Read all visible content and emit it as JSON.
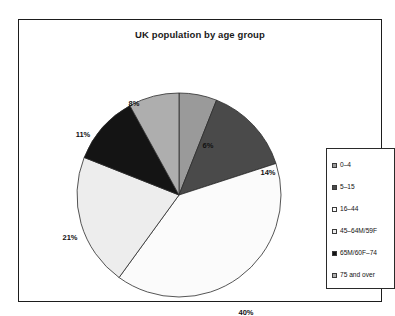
{
  "chart": {
    "title": "UK population by age group",
    "frame_color": "#1d1d1d",
    "background": "#ffffff"
  },
  "legend": {
    "position": "right",
    "border_color": "#2a2a2a",
    "items": [
      {
        "label": "0–4",
        "color": "#9a9a9a"
      },
      {
        "label": "5–15",
        "color": "#4a4a4a"
      },
      {
        "label": "16–44",
        "color": "#fbfbfb"
      },
      {
        "label": "45–64M/59F",
        "color": "#ededed"
      },
      {
        "label": "65M/60F–74",
        "color": "#141414"
      },
      {
        "label": "75 and over",
        "color": "#aeaeae"
      }
    ]
  },
  "chart_data": {
    "type": "pie",
    "title": "UK population by age group",
    "xlabel": "",
    "ylabel": "",
    "categories": [
      "0–4",
      "5–15",
      "16–44",
      "45–64M/59F",
      "65M/60F–74",
      "75 and over"
    ],
    "values": [
      6,
      14,
      40,
      21,
      11,
      8
    ],
    "unit": "%",
    "data_labels": [
      "6%",
      "14%",
      "40%",
      "21%",
      "11%",
      "8%"
    ],
    "colors": [
      "#9a9a9a",
      "#4a4a4a",
      "#fbfbfb",
      "#ededed",
      "#141414",
      "#aeaeae"
    ],
    "start_angle_deg": 0,
    "direction": "clockwise",
    "grid": false,
    "legend_position": "right",
    "label_positions": [
      {
        "label": "6%",
        "x": 147,
        "y": 53
      },
      {
        "label": "14%",
        "x": 207,
        "y": 80
      },
      {
        "label": "40%",
        "x": 185,
        "y": 220
      },
      {
        "label": "21%",
        "x": 9,
        "y": 145
      },
      {
        "label": "11%",
        "x": 22,
        "y": 42
      },
      {
        "label": "8%",
        "x": 73,
        "y": 11
      }
    ]
  }
}
